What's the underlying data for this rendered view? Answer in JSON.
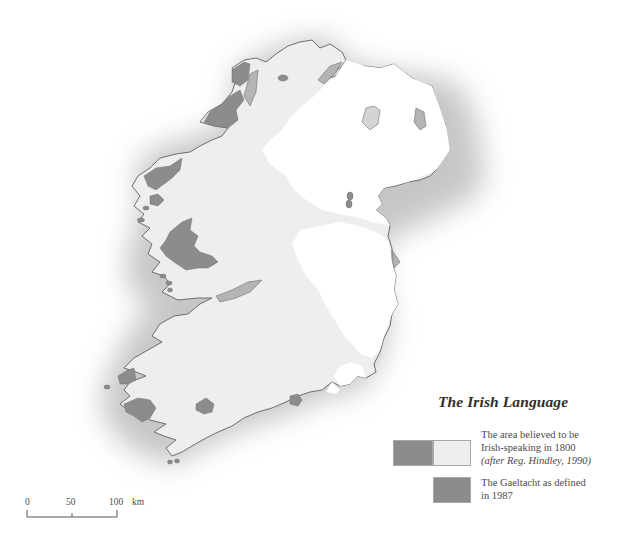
{
  "map": {
    "title": "The Irish Language",
    "colors": {
      "sea_halo": "#c9c9c9",
      "land_1800_irish": "#eeeeee",
      "land_english": "#ffffff",
      "gaeltacht_1987": "#8c8c8c",
      "coast_outline": "#6e6e6e",
      "estuary_fill": "#b4b4b4"
    }
  },
  "legend": {
    "title": "The Irish Language",
    "items": [
      {
        "label_line1": "The area believed to be",
        "label_line2": "Irish-speaking in 1800",
        "label_source": "(after Reg. Hindley, 1990)",
        "swatch_colors": [
          "#8c8c8c",
          "#eeeeee"
        ]
      },
      {
        "label_line1": "The Gaeltacht as defined",
        "label_line2": "in 1987",
        "swatch_colors": [
          "#8c8c8c"
        ]
      }
    ]
  },
  "scale_bar": {
    "ticks": [
      "0",
      "50",
      "100"
    ],
    "unit": "km"
  }
}
